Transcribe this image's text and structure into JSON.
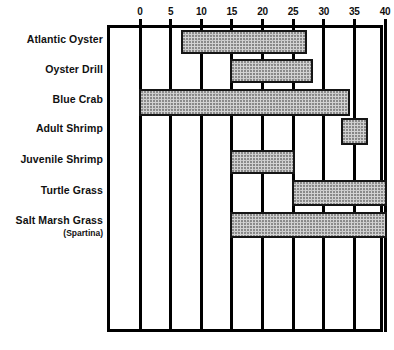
{
  "chart_data": {
    "type": "bar",
    "orientation": "horizontal",
    "title": "",
    "xlabel": "",
    "ylabel": "",
    "xlim": [
      0,
      40
    ],
    "xticks": [
      0,
      5,
      10,
      15,
      20,
      25,
      30,
      35,
      40
    ],
    "xtick_labels": [
      "0",
      "5",
      "10",
      "15",
      "20",
      "25",
      "30",
      "35",
      "40"
    ],
    "grid": true,
    "axis_position": "top",
    "legend": "none",
    "categories": [
      "Atlantic Oyster",
      "Oyster Drill",
      "Blue Crab",
      "Adult Shrimp",
      "Juvenile Shrimp",
      "Turtle Grass",
      "Salt Marsh Grass"
    ],
    "bars": [
      {
        "category": "Atlantic Oyster",
        "start": 7,
        "end": 27
      },
      {
        "category": "Oyster Drill",
        "start": 15,
        "end": 28
      },
      {
        "category": "Blue Crab",
        "start": 0,
        "end": 34
      },
      {
        "category": "Adult Shrimp",
        "start": 33,
        "end": 37
      },
      {
        "category": "Juvenile Shrimp",
        "start": 15,
        "end": 25
      },
      {
        "category": "Turtle Grass",
        "start": 25,
        "end": 40
      },
      {
        "category": "Salt Marsh Grass",
        "start": 15,
        "end": 40
      }
    ]
  },
  "labels": [
    {
      "text": "Atlantic Oyster",
      "sub": ""
    },
    {
      "text": "Oyster Drill",
      "sub": ""
    },
    {
      "text": "Blue Crab",
      "sub": ""
    },
    {
      "text": "Adult Shrimp",
      "sub": ""
    },
    {
      "text": "Juvenile Shrimp",
      "sub": ""
    },
    {
      "text": "Turtle Grass",
      "sub": ""
    },
    {
      "text": "Salt Marsh Grass",
      "sub": "(Spartina)"
    }
  ],
  "colors": {
    "bar_fill": "#d3d3d3",
    "bar_stroke": "#151515",
    "axis": "#000000",
    "text": "#111111",
    "background": "#ffffff"
  }
}
